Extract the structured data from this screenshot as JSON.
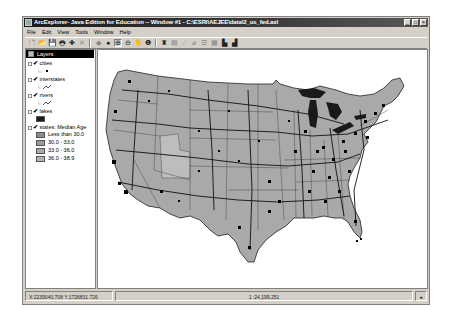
{
  "window": {
    "title": "ArcExplorer- Java Edition for Education -- Window #1 - C:\\ESRI\\AEJEE\\data\\2_us_fed.axl",
    "controls": {
      "minimize": "_",
      "maximize": "□",
      "close": "×"
    }
  },
  "menubar": {
    "items": [
      {
        "label": "File"
      },
      {
        "label": "Edit"
      },
      {
        "label": "View"
      },
      {
        "label": "Tools"
      },
      {
        "label": "Window"
      },
      {
        "label": "Help"
      }
    ]
  },
  "toolbar": {
    "groups": [
      [
        {
          "name": "new-map",
          "icon": "new-document-icon",
          "glyph": "🗋"
        },
        {
          "name": "open",
          "icon": "open-folder-icon",
          "glyph": "📂"
        },
        {
          "name": "save",
          "icon": "save-icon",
          "glyph": "💾"
        },
        {
          "name": "print",
          "icon": "print-icon",
          "glyph": "🖶"
        },
        {
          "name": "add-layer",
          "icon": "add-layer-icon",
          "glyph": "✚"
        },
        {
          "name": "delete-layer",
          "icon": "delete-icon",
          "glyph": "✕",
          "disabled": true
        }
      ],
      [
        {
          "name": "zoom-previous",
          "icon": "back-icon",
          "glyph": "◆",
          "disabled": true
        },
        {
          "name": "full-extent",
          "icon": "globe-icon",
          "glyph": "●"
        },
        {
          "name": "zoom-in",
          "icon": "zoom-in-icon",
          "glyph": "⊕",
          "pressed": true
        },
        {
          "name": "zoom-out",
          "icon": "zoom-out-icon",
          "glyph": "⊖"
        },
        {
          "name": "pan",
          "icon": "hand-icon",
          "glyph": "✋"
        },
        {
          "name": "identify",
          "icon": "info-icon",
          "glyph": "❶"
        }
      ],
      [
        {
          "name": "find",
          "icon": "binoculars-icon",
          "glyph": "♜"
        },
        {
          "name": "query",
          "icon": "query-icon",
          "glyph": "▤",
          "disabled": true
        },
        {
          "name": "measure",
          "icon": "measure-icon",
          "glyph": "⟋",
          "disabled": true
        },
        {
          "name": "clear-selection",
          "icon": "eraser-icon",
          "glyph": "⌀",
          "disabled": true
        },
        {
          "name": "attributes",
          "icon": "table-icon",
          "glyph": "☰",
          "disabled": true
        },
        {
          "name": "buffer",
          "icon": "grid-icon",
          "glyph": "▦",
          "disabled": true
        },
        {
          "name": "map-tips",
          "icon": "map-tips-icon",
          "glyph": "▙"
        },
        {
          "name": "layer-properties",
          "icon": "properties-icon",
          "glyph": "▟"
        }
      ]
    ]
  },
  "layers": {
    "header": "Layers",
    "items": [
      {
        "name": "cities",
        "checked": true,
        "symbol": "point"
      },
      {
        "name": "interstates",
        "checked": true,
        "symbol": "line"
      },
      {
        "name": "rivers",
        "checked": true,
        "symbol": "line"
      },
      {
        "name": "lakes",
        "checked": true,
        "symbol": "fill",
        "color": "#1a1a1a"
      },
      {
        "name": "states: Median Age",
        "checked": true,
        "classes": [
          {
            "label": "Less than 30.0",
            "color": "#8c8c8c"
          },
          {
            "label": "30.0 - 33.0",
            "color": "#9a9a9a"
          },
          {
            "label": "33.0 - 36.0",
            "color": "#a8a8a8"
          },
          {
            "label": "36.0 - 38.9",
            "color": "#b4b4b4"
          }
        ]
      }
    ]
  },
  "map": {
    "state_fill": "#a9a9a9",
    "lake_fill": "#1a1a1a",
    "feature_color": "#111111"
  },
  "statusbar": {
    "coordinates": "X:2239040.708 Y:1726831.726",
    "scale": "1 :24,199,251",
    "status_icon": "globe-icon"
  }
}
